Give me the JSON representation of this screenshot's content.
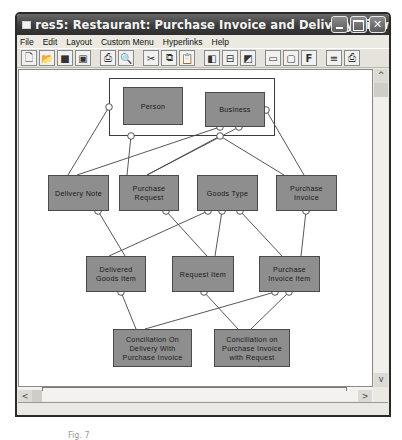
{
  "window": {
    "title": "res5: Restaurant: Purchase Invoice and Delivery View",
    "buttons": [
      "minimize",
      "maximize",
      "close"
    ]
  },
  "menubar": {
    "items": [
      "File",
      "Edit",
      "Layout",
      "Custom Menu",
      "Hyperlinks",
      "Help"
    ]
  },
  "toolbar": {
    "groups": [
      [
        "new-icon",
        "open-icon",
        "save-icon",
        "save-all-icon"
      ],
      [
        "print-icon",
        "print-preview-icon"
      ],
      [
        "cut-icon",
        "copy-icon",
        "paste-icon"
      ],
      [
        "layout-left-icon",
        "layout-center-icon",
        "layout-right-icon"
      ],
      [
        "view-a-icon",
        "view-b-icon",
        "font-icon"
      ],
      [
        "align-icon",
        "printer-icon"
      ]
    ]
  },
  "diagram": {
    "group": {
      "label": ""
    },
    "nodes": [
      {
        "id": "person",
        "label": "Person"
      },
      {
        "id": "business",
        "label": "Business"
      },
      {
        "id": "delivery_note",
        "label": "Delivery Note"
      },
      {
        "id": "purchase_request",
        "label": "Purchase Request"
      },
      {
        "id": "goods_type",
        "label": "Goods Type"
      },
      {
        "id": "purchase_invoice",
        "label": "Purchase Invoice"
      },
      {
        "id": "delivered_goods_item",
        "label": "Delivered Goods Item"
      },
      {
        "id": "request_item",
        "label": "Request Item"
      },
      {
        "id": "purchase_invoice_item",
        "label": "Purchase Invoice Item"
      },
      {
        "id": "conciliation_delivery",
        "label": "Conciliation On Delivery With Purchase Invoice"
      },
      {
        "id": "conciliation_purchase",
        "label": "Conciliation on Purchase Invoice with Request"
      }
    ],
    "colors": {
      "node_fill": "#8e8e8e",
      "node_border": "#4a4a4a",
      "link": "#444444"
    }
  },
  "scrollbars": {
    "up": "^",
    "down": "v",
    "left": "<",
    "right": ">"
  },
  "statusbar": {
    "text": ""
  },
  "caption": {
    "text": "Fig. 7"
  }
}
